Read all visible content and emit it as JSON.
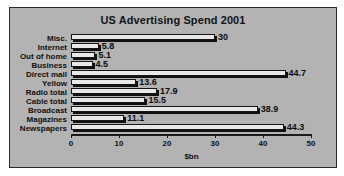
{
  "chart_data": {
    "type": "bar",
    "orientation": "horizontal",
    "title": "US Advertising Spend 2001",
    "xlabel": "$bn",
    "ylabel": "",
    "xlim": [
      0,
      50
    ],
    "xticks": [
      0,
      10,
      20,
      30,
      40,
      50
    ],
    "xtick_labels": [
      "0",
      "10",
      "20",
      "30",
      "40",
      "50"
    ],
    "grid": false,
    "legend": false,
    "categories": [
      "Misc.",
      "Internet",
      "Out of home",
      "Business",
      "Direct mail",
      "Yellow",
      "Radio total",
      "Cable total",
      "Broadcast",
      "Magazines",
      "Newspapers"
    ],
    "values": [
      30,
      5.8,
      5.1,
      4.5,
      44.7,
      13.6,
      17.9,
      15.5,
      38.9,
      11.1,
      44.3
    ],
    "value_labels": [
      "30",
      "5.8",
      "5.1",
      "4.5",
      "44.7",
      "13.6",
      "17.9",
      "15.5",
      "38.9",
      "11.1",
      "44.3"
    ],
    "colors": {
      "panel_background": "#b3b3b3",
      "page_background": "#ffffff",
      "bar_fill": "#e8e8e8",
      "bar_edge": "#161616",
      "bar_shadow": "#111111",
      "text": "#111111",
      "axis": "#1a1a1a"
    }
  }
}
